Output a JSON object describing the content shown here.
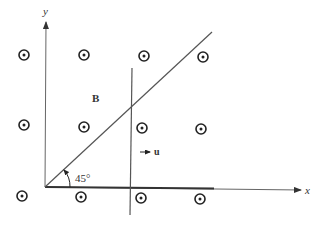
{
  "diagram": {
    "axes": {
      "x_label": "x",
      "y_label": "y"
    },
    "field_label": "B",
    "velocity_label": "u",
    "angle_label": "45°",
    "field_symbol": "out-of-page (dot in circle)",
    "field_points": [
      {
        "x": 24,
        "y": 55
      },
      {
        "x": 84,
        "y": 55
      },
      {
        "x": 144,
        "y": 56
      },
      {
        "x": 203,
        "y": 57
      },
      {
        "x": 24,
        "y": 125
      },
      {
        "x": 84,
        "y": 127
      },
      {
        "x": 142,
        "y": 128
      },
      {
        "x": 201,
        "y": 129
      },
      {
        "x": 22,
        "y": 196
      },
      {
        "x": 81,
        "y": 197
      },
      {
        "x": 141,
        "y": 198
      },
      {
        "x": 200,
        "y": 199
      }
    ],
    "colors": {
      "line": "#555555",
      "rail": "#333333",
      "symbol": "#222222"
    }
  }
}
